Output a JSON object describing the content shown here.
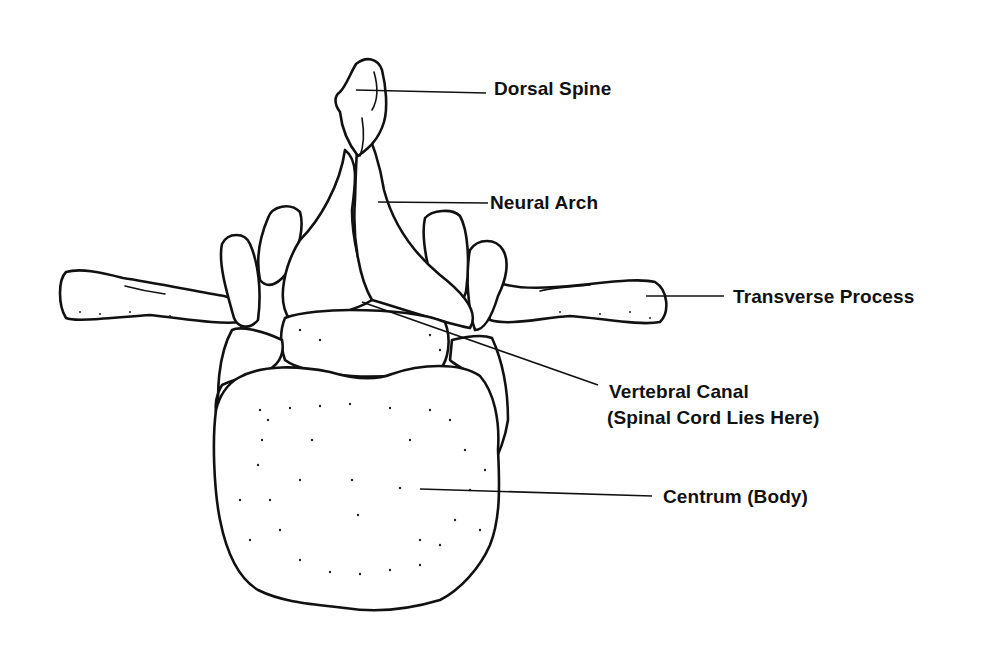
{
  "diagram": {
    "labels": [
      {
        "id": "dorsal_spine",
        "text": "Dorsal Spine"
      },
      {
        "id": "neural_arch",
        "text": "Neural Arch"
      },
      {
        "id": "transverse_process",
        "text": "Transverse Process"
      },
      {
        "id": "vertebral_canal",
        "text": "Vertebral Canal",
        "subtext": "(Spinal Cord Lies Here)"
      },
      {
        "id": "centrum",
        "text": "Centrum (Body)"
      }
    ],
    "colors": {
      "line": "#111111",
      "background": "#ffffff"
    }
  }
}
